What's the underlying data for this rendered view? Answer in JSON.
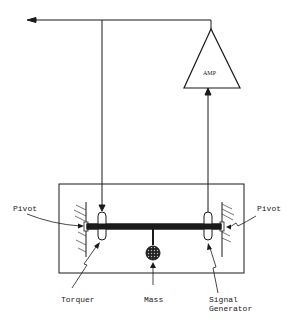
{
  "diagram": {
    "amplifier": {
      "label": "AMP"
    },
    "labels": {
      "pivot_left": "Pivot",
      "pivot_right": "Pivot",
      "torquer": "Torquer",
      "mass": "Mass",
      "signal_generator_line1": "Signal",
      "signal_generator_line2": "Generator"
    },
    "colors": {
      "line": "#1a1a1a",
      "background": "#ffffff"
    }
  }
}
